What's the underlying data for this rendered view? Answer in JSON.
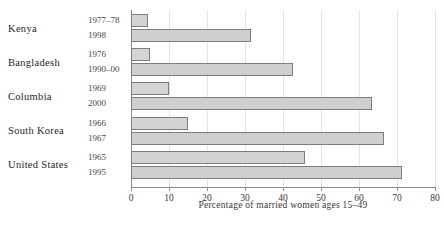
{
  "chart_data": {
    "type": "bar",
    "orientation": "horizontal",
    "title": "",
    "xlabel": "Percentage of married women ages 15–49",
    "ylabel": "",
    "xlim": [
      0,
      80
    ],
    "xticks": [
      0,
      10,
      20,
      30,
      40,
      50,
      60,
      70,
      80
    ],
    "xtick_labels": [
      "0",
      "10",
      "20",
      "30",
      "40",
      "50",
      "60",
      "70",
      "80"
    ],
    "grid": true,
    "legend": "none",
    "groups": [
      {
        "country": "Kenya",
        "bars": [
          {
            "year": "1977–78",
            "value": 4.5
          },
          {
            "year": "1998",
            "value": 31.5
          }
        ]
      },
      {
        "country": "Bangladesh",
        "bars": [
          {
            "year": "1976",
            "value": 5.0
          },
          {
            "year": "1990–00",
            "value": 42.5
          }
        ]
      },
      {
        "country": "Columbia",
        "bars": [
          {
            "year": "1969",
            "value": 10.0
          },
          {
            "year": "2000",
            "value": 63.5
          }
        ]
      },
      {
        "country": "South Korea",
        "bars": [
          {
            "year": "1966",
            "value": 15.0
          },
          {
            "year": "1967",
            "value": 66.5
          }
        ]
      },
      {
        "country": "United States",
        "bars": [
          {
            "year": "1965",
            "value": 45.8
          },
          {
            "year": "1995",
            "value": 71.3
          }
        ]
      }
    ],
    "colors": {
      "bar_fill": "#d4d4d4",
      "bar_border": "#7d7d7d",
      "grid": "#e4e4e4",
      "axis": "#8c8c8c"
    }
  }
}
